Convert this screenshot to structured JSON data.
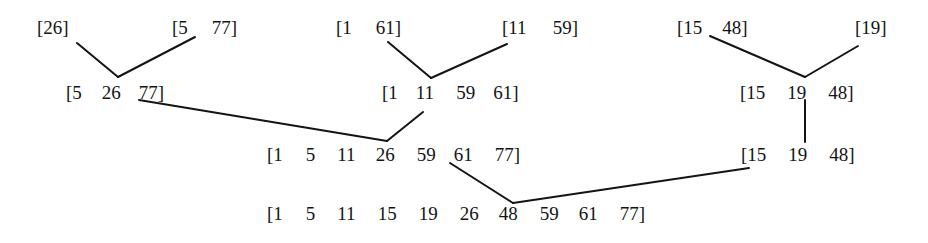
{
  "diagram": {
    "title": "",
    "type": "merge-sort-tree",
    "levels": [
      {
        "level": 1,
        "nodes": [
          {
            "id": "n1a",
            "values": [
              "26"
            ],
            "x": 37,
            "y": 17,
            "gaps": [
              0
            ]
          },
          {
            "id": "n1b",
            "values": [
              "5",
              "77"
            ],
            "x": 172,
            "y": 17,
            "gaps": [
              0,
              24
            ]
          },
          {
            "id": "n1c",
            "values": [
              "1",
              "61"
            ],
            "x": 336,
            "y": 17,
            "gaps": [
              0,
              24
            ]
          },
          {
            "id": "n1d",
            "values": [
              "11",
              "59"
            ],
            "x": 502,
            "y": 17,
            "gaps": [
              0,
              26
            ]
          },
          {
            "id": "n1e",
            "values": [
              "15",
              "48"
            ],
            "x": 677,
            "y": 17,
            "gaps": [
              0,
              20
            ]
          },
          {
            "id": "n1f",
            "values": [
              "19"
            ],
            "x": 855,
            "y": 17,
            "gaps": [
              0
            ]
          }
        ]
      },
      {
        "level": 2,
        "nodes": [
          {
            "id": "n2a",
            "values": [
              "5",
              "26",
              "77"
            ],
            "x": 66,
            "y": 82,
            "gaps": [
              0,
              20,
              18
            ]
          },
          {
            "id": "n2b",
            "values": [
              "1",
              "11",
              "59",
              "61"
            ],
            "x": 382,
            "y": 82,
            "gaps": [
              0,
              18,
              22,
              18
            ]
          },
          {
            "id": "n2c",
            "values": [
              "15",
              "19",
              "48"
            ],
            "x": 740,
            "y": 82,
            "gaps": [
              0,
              22,
              22
            ]
          }
        ]
      },
      {
        "level": 3,
        "nodes": [
          {
            "id": "n3a",
            "values": [
              "1",
              "5",
              "11",
              "26",
              "59",
              "61",
              "77"
            ],
            "x": 267,
            "y": 144,
            "gaps": [
              0,
              23,
              22,
              20,
              22,
              18,
              22
            ]
          },
          {
            "id": "n3b",
            "values": [
              "15",
              "19",
              "48"
            ],
            "x": 741,
            "y": 144,
            "gaps": [
              0,
              22,
              22
            ]
          }
        ]
      },
      {
        "level": 4,
        "nodes": [
          {
            "id": "n4a",
            "values": [
              "1",
              "5",
              "11",
              "15",
              "19",
              "26",
              "48",
              "59",
              "61",
              "77"
            ],
            "x": 267,
            "y": 203,
            "gaps": [
              0,
              23,
              22,
              22,
              22,
              22,
              20,
              22,
              20,
              22
            ]
          }
        ]
      }
    ],
    "edges": [
      {
        "from": "n1a",
        "to": "n2a",
        "x1": 77,
        "y1": 43,
        "x2": 118,
        "y2": 77
      },
      {
        "from": "n1b",
        "to": "n2a",
        "x1": 195,
        "y1": 37,
        "x2": 118,
        "y2": 77
      },
      {
        "from": "n1c",
        "to": "n2b",
        "x1": 388,
        "y1": 42,
        "x2": 431,
        "y2": 78
      },
      {
        "from": "n1d",
        "to": "n2b",
        "x1": 507,
        "y1": 44,
        "x2": 431,
        "y2": 78
      },
      {
        "from": "n1e",
        "to": "n2c",
        "x1": 710,
        "y1": 36,
        "x2": 805,
        "y2": 77
      },
      {
        "from": "n1f",
        "to": "n2c",
        "x1": 858,
        "y1": 46,
        "x2": 805,
        "y2": 77
      },
      {
        "from": "n2a",
        "to": "n3a",
        "x1": 139,
        "y1": 100,
        "x2": 387,
        "y2": 141
      },
      {
        "from": "n2b",
        "to": "n3a",
        "x1": 423,
        "y1": 112,
        "x2": 387,
        "y2": 141
      },
      {
        "from": "n2c",
        "to": "n3b",
        "x1": 805,
        "y1": 100,
        "x2": 805,
        "y2": 142
      },
      {
        "from": "n3a",
        "to": "n4a",
        "x1": 450,
        "y1": 163,
        "x2": 513,
        "y2": 203
      },
      {
        "from": "n3b",
        "to": "n4a",
        "x1": 749,
        "y1": 168,
        "x2": 513,
        "y2": 203
      }
    ],
    "bracket_open": "[",
    "bracket_close": "]",
    "colors": {
      "ink": "#141414",
      "background": "#ffffff"
    }
  }
}
